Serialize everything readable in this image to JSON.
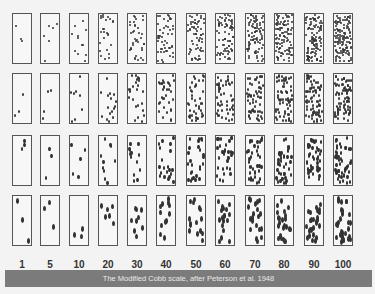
{
  "figure": {
    "title": "Modified Cobb scale",
    "caption": "The Modified Cobb scale, after  Peterson et al. 1948",
    "rows": 4,
    "percent_labels": [
      "1",
      "5",
      "10",
      "20",
      "30",
      "40",
      "50",
      "60",
      "70",
      "80",
      "90",
      "100"
    ],
    "row_descriptions": [
      "fine dots",
      "small elongated dots",
      "medium elongated dots",
      "large elongated dots"
    ],
    "colors": {
      "background": "#f3f3f3",
      "box_border": "#555555",
      "dot": "#333333",
      "caption_bar": "#7b7b7b",
      "caption_text": "#eaeaea"
    }
  }
}
